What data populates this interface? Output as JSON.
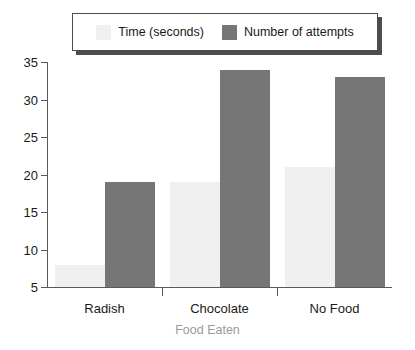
{
  "chart_data": {
    "type": "bar",
    "title": "",
    "subtitle": "",
    "xlabel": "Food Eaten",
    "ylabel": "",
    "categories": [
      "Radish",
      "Chocolate",
      "No Food"
    ],
    "series": [
      {
        "name": "Time (seconds)",
        "values": [
          8,
          19,
          21
        ],
        "color": "#f0f0f0"
      },
      {
        "name": "Number of attempts",
        "values": [
          19,
          34,
          33
        ],
        "color": "#767676"
      }
    ],
    "ylim": [
      5,
      35
    ],
    "yticks": [
      5,
      10,
      15,
      20,
      25,
      30,
      35
    ],
    "ytick_labels": [
      "5",
      "10",
      "15",
      "20",
      "25",
      "30",
      "35"
    ],
    "grid": false,
    "legend_position": "top-center",
    "axis_color": "#5a5a5a",
    "xlabel_color": "#9a9a9a",
    "tick_label_color": "#1a1a1a"
  },
  "legend": {
    "entries": [
      {
        "label": "Time (seconds)",
        "swatch": "legend-swatch-time"
      },
      {
        "label": "Number of attempts",
        "swatch": "legend-swatch-attempts"
      }
    ]
  }
}
